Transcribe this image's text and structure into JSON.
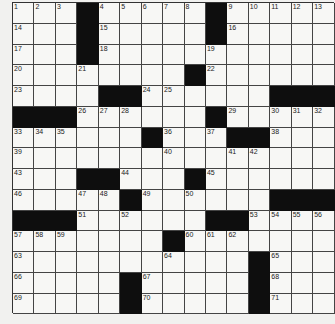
{
  "puzzle": {
    "rows": 15,
    "cols": 15,
    "colors": {
      "black": "#0e0e0e",
      "white": "#f7f7f5",
      "paper": "#f1f1ef",
      "line": "#444444"
    },
    "grid": [
      ".1.2.3#.4.5.6.7.8#.9.10.11.12.13",
      ".14..#.15....#.16...",
      ".17..#.18....19.....",
      ".20..21....#.22.....",
      ".23...##.24.25....###",
      "###.26.27.28...#.29..30.31.32",
      ".33.34.35...#.36..37##.38..",
      ".39.......40...41.42...",
      ".43..##.44..#.45.....",
      ".46..47.48#.49..50...###",
      "###.51..52...##.53.54.55.56",
      ".57.58.59....#.60.61.62....",
      ".63......64....#.65..",
      ".66....#.67....#.68..",
      ".69....#.70....#.71.."
    ],
    "black_cells": [
      [
        0,
        3
      ],
      [
        0,
        9
      ],
      [
        1,
        3
      ],
      [
        1,
        9
      ],
      [
        2,
        3
      ],
      [
        3,
        8
      ],
      [
        4,
        4
      ],
      [
        4,
        5
      ],
      [
        4,
        12
      ],
      [
        4,
        13
      ],
      [
        4,
        14
      ],
      [
        5,
        0
      ],
      [
        5,
        1
      ],
      [
        5,
        2
      ],
      [
        5,
        9
      ],
      [
        6,
        6
      ],
      [
        6,
        10
      ],
      [
        6,
        11
      ],
      [
        8,
        3
      ],
      [
        8,
        4
      ],
      [
        8,
        8
      ],
      [
        9,
        5
      ],
      [
        9,
        12
      ],
      [
        9,
        13
      ],
      [
        9,
        14
      ],
      [
        10,
        0
      ],
      [
        10,
        1
      ],
      [
        10,
        2
      ],
      [
        10,
        9
      ],
      [
        10,
        10
      ],
      [
        11,
        7
      ],
      [
        12,
        11
      ],
      [
        13,
        5
      ],
      [
        13,
        11
      ],
      [
        14,
        5
      ],
      [
        14,
        11
      ]
    ],
    "numbers": [
      [
        0,
        0,
        "1"
      ],
      [
        0,
        1,
        "2"
      ],
      [
        0,
        2,
        "3"
      ],
      [
        0,
        4,
        "4"
      ],
      [
        0,
        5,
        "5"
      ],
      [
        0,
        6,
        "6"
      ],
      [
        0,
        7,
        "7"
      ],
      [
        0,
        8,
        "8"
      ],
      [
        0,
        10,
        "9"
      ],
      [
        0,
        11,
        "10"
      ],
      [
        0,
        12,
        "11"
      ],
      [
        0,
        13,
        "12"
      ],
      [
        0,
        14,
        "13"
      ],
      [
        1,
        0,
        "14"
      ],
      [
        1,
        4,
        "15"
      ],
      [
        1,
        10,
        "16"
      ],
      [
        2,
        0,
        "17"
      ],
      [
        2,
        4,
        "18"
      ],
      [
        2,
        9,
        "19"
      ],
      [
        3,
        0,
        "20"
      ],
      [
        3,
        3,
        "21"
      ],
      [
        3,
        9,
        "22"
      ],
      [
        4,
        0,
        "23"
      ],
      [
        4,
        6,
        "24"
      ],
      [
        4,
        7,
        "25"
      ],
      [
        5,
        3,
        "26"
      ],
      [
        5,
        4,
        "27"
      ],
      [
        5,
        5,
        "28"
      ],
      [
        5,
        10,
        "29"
      ],
      [
        5,
        12,
        "30"
      ],
      [
        5,
        13,
        "31"
      ],
      [
        5,
        14,
        "32"
      ],
      [
        6,
        0,
        "33"
      ],
      [
        6,
        1,
        "34"
      ],
      [
        6,
        2,
        "35"
      ],
      [
        6,
        7,
        "36"
      ],
      [
        6,
        9,
        "37"
      ],
      [
        6,
        12,
        "38"
      ],
      [
        7,
        0,
        "39"
      ],
      [
        7,
        7,
        "40"
      ],
      [
        7,
        10,
        "41"
      ],
      [
        7,
        11,
        "42"
      ],
      [
        8,
        0,
        "43"
      ],
      [
        8,
        5,
        "44"
      ],
      [
        8,
        9,
        "45"
      ],
      [
        9,
        0,
        "46"
      ],
      [
        9,
        3,
        "47"
      ],
      [
        9,
        4,
        "48"
      ],
      [
        9,
        6,
        "49"
      ],
      [
        9,
        8,
        "50"
      ],
      [
        10,
        3,
        "51"
      ],
      [
        10,
        5,
        "52"
      ],
      [
        10,
        11,
        "53"
      ],
      [
        10,
        12,
        "54"
      ],
      [
        10,
        13,
        "55"
      ],
      [
        10,
        14,
        "56"
      ],
      [
        11,
        0,
        "57"
      ],
      [
        11,
        1,
        "58"
      ],
      [
        11,
        2,
        "59"
      ],
      [
        11,
        8,
        "60"
      ],
      [
        11,
        9,
        "61"
      ],
      [
        11,
        10,
        "62"
      ],
      [
        12,
        0,
        "63"
      ],
      [
        12,
        7,
        "64"
      ],
      [
        12,
        12,
        "65"
      ],
      [
        13,
        0,
        "66"
      ],
      [
        13,
        6,
        "67"
      ],
      [
        13,
        12,
        "68"
      ],
      [
        14,
        0,
        "69"
      ],
      [
        14,
        6,
        "70"
      ],
      [
        14,
        12,
        "71"
      ]
    ]
  }
}
